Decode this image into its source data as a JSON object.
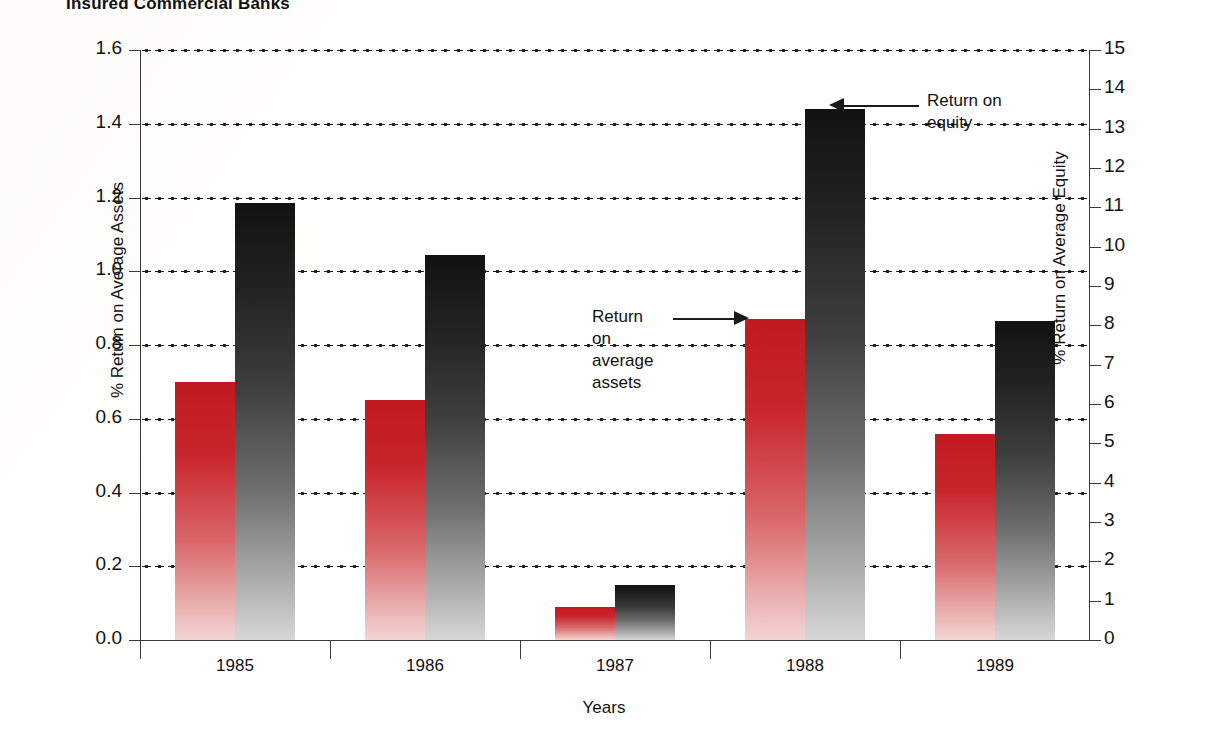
{
  "chart_data": {
    "type": "bar",
    "title": "Insured Commercial Banks",
    "xlabel": "Years",
    "ylabel": "% Return on Average Assets",
    "ylabel_right": "% Return on Average Equity",
    "categories": [
      "1985",
      "1986",
      "1987",
      "1988",
      "1989"
    ],
    "ylim": [
      0.0,
      1.6
    ],
    "ylim_right": [
      0,
      15
    ],
    "yticks": [
      "1.6",
      "1.4",
      "1.2",
      "1.0",
      "0.8",
      "0.6",
      "0.4",
      "0.2",
      "0.0"
    ],
    "ytick_values": [
      1.6,
      1.4,
      1.2,
      1.0,
      0.8,
      0.6,
      0.4,
      0.2,
      0.0
    ],
    "yticks_right": [
      "15",
      "14",
      "13",
      "12",
      "11",
      "10",
      "9",
      "8",
      "7",
      "6",
      "5",
      "4",
      "3",
      "2",
      "1",
      "0"
    ],
    "ytick_values_right": [
      15,
      14,
      13,
      12,
      11,
      10,
      9,
      8,
      7,
      6,
      5,
      4,
      3,
      2,
      1,
      0
    ],
    "grid": true,
    "grid_style": "dotted",
    "legend_position": "annotations",
    "series": [
      {
        "name": "Return on average assets",
        "axis": "left",
        "color": "#bf1a20",
        "values": [
          0.7,
          0.65,
          0.09,
          0.87,
          0.56
        ]
      },
      {
        "name": "Return on equity",
        "axis": "right",
        "color": "#1b1b1b",
        "values": [
          11.1,
          9.8,
          1.4,
          13.5,
          8.1
        ]
      }
    ],
    "annotations": [
      {
        "id": "equity",
        "text": "Return on\nequity",
        "arrow": "left",
        "target": "1988 equity bar"
      },
      {
        "id": "assets",
        "text": "Return\non\naverage\nassets",
        "arrow": "right",
        "target": "1988 assets bar"
      }
    ]
  },
  "colors": {
    "assets_bar": "#bf1a20",
    "equity_bar": "#1b1b1b",
    "axis": "#3a3a3a",
    "text": "#111111",
    "background": "#ffffff"
  }
}
